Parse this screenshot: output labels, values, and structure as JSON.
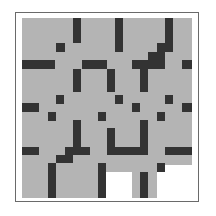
{
  "puzzle": {
    "type": "grid-maze",
    "colors": {
      "background": "#ffffff",
      "border": "#6a6a6a",
      "floor": "#b4b4b4",
      "wall": "#333333"
    },
    "floor_regions": [
      {
        "x": 22,
        "y": 18,
        "w": 170,
        "h": 147
      },
      {
        "x": 22,
        "y": 165,
        "w": 84,
        "h": 33
      },
      {
        "x": 106,
        "y": 165,
        "w": 51,
        "h": 7
      },
      {
        "x": 132,
        "y": 172,
        "w": 25,
        "h": 26
      }
    ],
    "walls": [
      {
        "x": 73,
        "y": 18,
        "w": 8,
        "h": 25
      },
      {
        "x": 115,
        "y": 18,
        "w": 8,
        "h": 34
      },
      {
        "x": 165,
        "y": 18,
        "w": 8,
        "h": 34
      },
      {
        "x": 56,
        "y": 43,
        "w": 9,
        "h": 9
      },
      {
        "x": 157,
        "y": 43,
        "w": 16,
        "h": 9
      },
      {
        "x": 148,
        "y": 52,
        "w": 17,
        "h": 8
      },
      {
        "x": 22,
        "y": 60,
        "w": 33,
        "h": 9
      },
      {
        "x": 82,
        "y": 60,
        "w": 25,
        "h": 9
      },
      {
        "x": 132,
        "y": 60,
        "w": 33,
        "h": 9
      },
      {
        "x": 182,
        "y": 60,
        "w": 10,
        "h": 9
      },
      {
        "x": 73,
        "y": 69,
        "w": 8,
        "h": 23
      },
      {
        "x": 107,
        "y": 69,
        "w": 8,
        "h": 23
      },
      {
        "x": 140,
        "y": 69,
        "w": 8,
        "h": 23
      },
      {
        "x": 56,
        "y": 95,
        "w": 8,
        "h": 9
      },
      {
        "x": 115,
        "y": 95,
        "w": 8,
        "h": 9
      },
      {
        "x": 165,
        "y": 95,
        "w": 8,
        "h": 9
      },
      {
        "x": 22,
        "y": 103,
        "w": 17,
        "h": 9
      },
      {
        "x": 132,
        "y": 103,
        "w": 8,
        "h": 9
      },
      {
        "x": 182,
        "y": 103,
        "w": 10,
        "h": 9
      },
      {
        "x": 48,
        "y": 112,
        "w": 8,
        "h": 9
      },
      {
        "x": 98,
        "y": 112,
        "w": 8,
        "h": 9
      },
      {
        "x": 157,
        "y": 112,
        "w": 8,
        "h": 9
      },
      {
        "x": 73,
        "y": 120,
        "w": 8,
        "h": 35
      },
      {
        "x": 107,
        "y": 128,
        "w": 8,
        "h": 27
      },
      {
        "x": 140,
        "y": 120,
        "w": 8,
        "h": 35
      },
      {
        "x": 22,
        "y": 147,
        "w": 17,
        "h": 8
      },
      {
        "x": 65,
        "y": 147,
        "w": 25,
        "h": 8
      },
      {
        "x": 115,
        "y": 147,
        "w": 25,
        "h": 8
      },
      {
        "x": 165,
        "y": 147,
        "w": 27,
        "h": 8
      },
      {
        "x": 56,
        "y": 155,
        "w": 17,
        "h": 8
      },
      {
        "x": 48,
        "y": 163,
        "w": 8,
        "h": 35
      },
      {
        "x": 98,
        "y": 163,
        "w": 8,
        "h": 35
      },
      {
        "x": 157,
        "y": 163,
        "w": 8,
        "h": 9
      },
      {
        "x": 140,
        "y": 172,
        "w": 8,
        "h": 26
      }
    ]
  }
}
